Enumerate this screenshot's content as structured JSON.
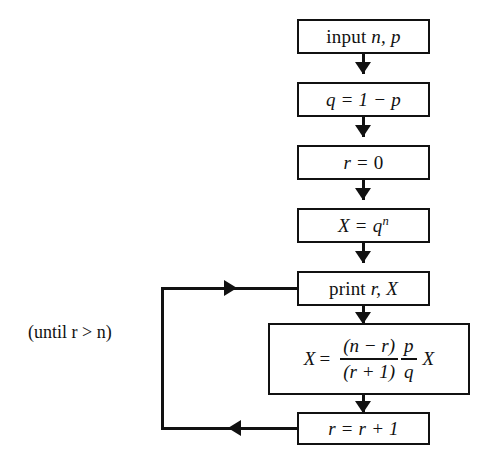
{
  "diagram": {
    "type": "flowchart",
    "line_color": "#111111",
    "background_color": "#ffffff",
    "nodes": [
      {
        "id": "input",
        "text": "input n, p",
        "plain": "input n, p"
      },
      {
        "id": "q",
        "text": "q = 1 - p",
        "plain": "q = 1 - p"
      },
      {
        "id": "r0",
        "text": "r = 0",
        "plain": "r = 0"
      },
      {
        "id": "xqn",
        "text": "X = q",
        "exponent": "n",
        "plain": "X = q^n"
      },
      {
        "id": "print",
        "text": "print r, X",
        "plain": "print r, X"
      },
      {
        "id": "update",
        "text": "X = ((n - r)/(r + 1)) (p/q) X",
        "plain": "X = ((n - r)/(r + 1)) (p/q) X"
      },
      {
        "id": "incr",
        "text": "r = r + 1",
        "plain": "r = r + 1"
      }
    ],
    "formula": {
      "lhs": "X",
      "equals": "=",
      "numerator": "(n − r)",
      "denominator": "(r + 1)",
      "small_numerator": "p",
      "small_denominator": "q",
      "trailing": "X"
    },
    "labels": {
      "print_prefix": "print",
      "print_vars": "r,  X",
      "input_prefix": "input",
      "input_vars": "n, p",
      "q_assign_lhs": "q",
      "q_assign_eq": "=",
      "q_assign_rhs": "1 − p",
      "r_zero_lhs": "r",
      "r_zero_eq": "=",
      "r_zero_rhs": "0",
      "x_qn_lhs": "X",
      "x_qn_eq": "=",
      "x_qn_base": "q",
      "x_qn_exp": "n",
      "incr_lhs": "r",
      "incr_eq": "=",
      "incr_rhs": "r + 1",
      "loop_condition": "(until r > n)"
    }
  }
}
